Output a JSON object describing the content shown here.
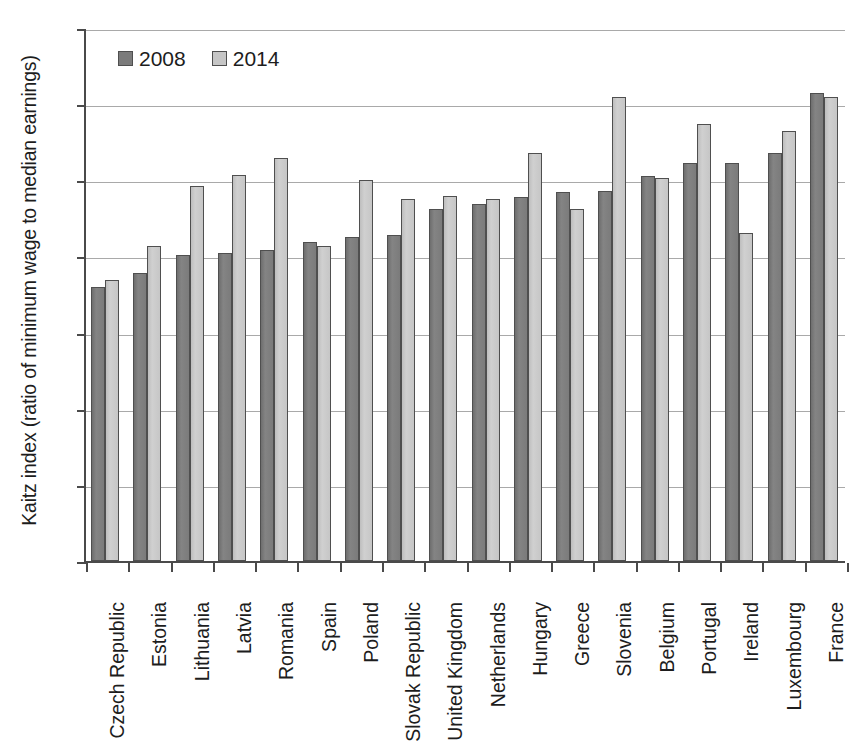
{
  "chart_data": {
    "type": "bar",
    "title": "",
    "xlabel": "",
    "ylabel": "Kaitz index (ratio of minimum wage to median earnings)",
    "ylim": [
      0,
      70
    ],
    "yticks": [
      0,
      10,
      20,
      30,
      40,
      50,
      60,
      70
    ],
    "grid": true,
    "legend_position": "top-left",
    "categories": [
      "Czech Republic",
      "Estonia",
      "Lithuania",
      "Latvia",
      "Romania",
      "Spain",
      "Poland",
      "Slovak Republic",
      "United Kingdom",
      "Netherlands",
      "Hungary",
      "Greece",
      "Slovenia",
      "Belgium",
      "Portugal",
      "Ireland",
      "Luxembourg",
      "France"
    ],
    "series": [
      {
        "name": "2008",
        "color": "#7b7b7b",
        "values": [
          36.0,
          37.8,
          40.2,
          40.5,
          40.8,
          41.9,
          42.6,
          42.8,
          46.2,
          46.9,
          47.8,
          48.5,
          48.6,
          50.6,
          52.3,
          52.3,
          53.6,
          61.5
        ]
      },
      {
        "name": "2014",
        "color": "#c6c6c6",
        "values": [
          36.9,
          41.4,
          49.3,
          50.7,
          52.9,
          41.4,
          50.1,
          47.6,
          48.0,
          47.5,
          53.6,
          46.2,
          61.0,
          50.3,
          57.4,
          43.1,
          56.5,
          61.0
        ]
      }
    ]
  },
  "colors": {
    "series_2008": "#7b7b7b",
    "series_2014": "#c6c6c6",
    "axis": "#4a4a4a",
    "grid": "#a9a9a9",
    "background": "#ffffff"
  }
}
